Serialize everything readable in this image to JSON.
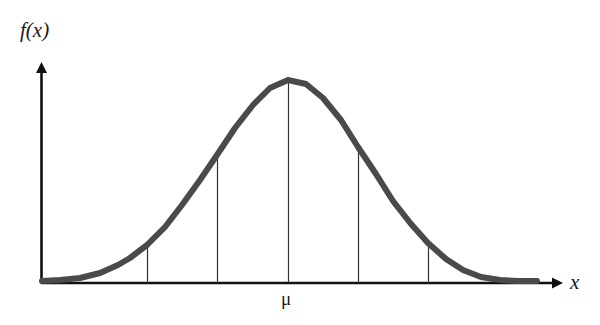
{
  "figure": {
    "background_color": "#ffffff",
    "axis_color": "#111111",
    "curve_color": "#4a4a4a",
    "gridline_color": "#333333"
  },
  "labels": {
    "y_axis": "f(x)",
    "x_axis": "x",
    "mean_tick": "μ"
  },
  "chart_data": {
    "type": "line",
    "title": "",
    "subtitle": "",
    "xlabel": "x",
    "ylabel": "f(x)",
    "legend": [],
    "grid": false,
    "annotations": [
      {
        "text": "μ",
        "x_px": 288,
        "y_px": 297,
        "role": "mean-tick-label"
      },
      {
        "text": "f(x)",
        "x_px": 30,
        "y_px": 30,
        "role": "y-axis-label"
      },
      {
        "text": "x",
        "x_px": 576,
        "y_px": 284,
        "role": "x-axis-label"
      }
    ],
    "axes": {
      "x_axis_y_px": 283,
      "x_axis_start_px": 41,
      "x_axis_end_px": 560,
      "y_axis_x_px": 41,
      "y_axis_top_px": 65,
      "y_axis_bottom_px": 283,
      "x_arrow": true,
      "y_arrow": true
    },
    "curve": {
      "distribution": "gaussian",
      "mean_px": 288,
      "sigma_px": 70,
      "peak_y_px": 80,
      "baseline_y_px": 281,
      "stroke_width_px": 6,
      "x_start_px": 42,
      "x_end_px": 537,
      "points": [
        {
          "x": 42,
          "y": 281
        },
        {
          "x": 60,
          "y": 280
        },
        {
          "x": 80,
          "y": 278
        },
        {
          "x": 100,
          "y": 273
        },
        {
          "x": 118,
          "y": 265
        },
        {
          "x": 130,
          "y": 258
        },
        {
          "x": 147,
          "y": 245
        },
        {
          "x": 165,
          "y": 227
        },
        {
          "x": 182,
          "y": 205
        },
        {
          "x": 200,
          "y": 180
        },
        {
          "x": 217,
          "y": 155
        },
        {
          "x": 235,
          "y": 128
        },
        {
          "x": 253,
          "y": 105
        },
        {
          "x": 270,
          "y": 88
        },
        {
          "x": 288,
          "y": 80
        },
        {
          "x": 306,
          "y": 84
        },
        {
          "x": 323,
          "y": 98
        },
        {
          "x": 341,
          "y": 120
        },
        {
          "x": 358,
          "y": 147
        },
        {
          "x": 376,
          "y": 174
        },
        {
          "x": 393,
          "y": 201
        },
        {
          "x": 411,
          "y": 224
        },
        {
          "x": 428,
          "y": 243
        },
        {
          "x": 446,
          "y": 259
        },
        {
          "x": 463,
          "y": 270
        },
        {
          "x": 481,
          "y": 277
        },
        {
          "x": 500,
          "y": 280
        },
        {
          "x": 518,
          "y": 281
        },
        {
          "x": 537,
          "y": 281
        }
      ]
    },
    "vertical_gridlines": [
      {
        "label": "",
        "x_px": 147,
        "top_y_px": 247,
        "bottom_y_px": 283,
        "sigma_offset": -2
      },
      {
        "label": "",
        "x_px": 217,
        "top_y_px": 157,
        "bottom_y_px": 283,
        "sigma_offset": -1
      },
      {
        "label": "μ",
        "x_px": 288,
        "top_y_px": 82,
        "bottom_y_px": 283,
        "sigma_offset": 0
      },
      {
        "label": "",
        "x_px": 358,
        "top_y_px": 149,
        "bottom_y_px": 283,
        "sigma_offset": 1
      },
      {
        "label": "",
        "x_px": 428,
        "top_y_px": 245,
        "bottom_y_px": 283,
        "sigma_offset": 2
      }
    ]
  }
}
